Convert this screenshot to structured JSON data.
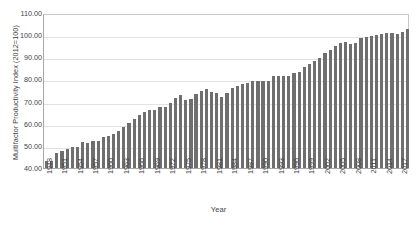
{
  "chart_data": {
    "type": "bar",
    "title": "",
    "xlabel": "Year",
    "ylabel": "Multifactor Productivity Index (2012=100)",
    "ylim": [
      40.0,
      110.0
    ],
    "ytick_labels": [
      "110.00",
      "100.00",
      "90.00",
      "80.00",
      "70.00",
      "60.00",
      "50.00",
      "40.00"
    ],
    "ytick_values": [
      110.0,
      100.0,
      90.0,
      80.0,
      70.0,
      60.0,
      50.0,
      40.0
    ],
    "grid": "horizontal",
    "legend": "none",
    "bar_color": "#6f6f6f",
    "xtick_labels": [
      "1948",
      "1951",
      "1954",
      "1957",
      "1960",
      "1963",
      "1966",
      "1969",
      "1972",
      "1975",
      "1978",
      "1981",
      "1984",
      "1987",
      "1990",
      "1993",
      "1996",
      "1999",
      "2002",
      "2005",
      "2008",
      "2011",
      "2014",
      "2017"
    ],
    "categories": [
      "1948",
      "1949",
      "1950",
      "1951",
      "1952",
      "1953",
      "1954",
      "1955",
      "1956",
      "1957",
      "1958",
      "1959",
      "1960",
      "1961",
      "1962",
      "1963",
      "1964",
      "1965",
      "1966",
      "1967",
      "1968",
      "1969",
      "1970",
      "1971",
      "1972",
      "1973",
      "1974",
      "1975",
      "1976",
      "1977",
      "1978",
      "1979",
      "1980",
      "1981",
      "1982",
      "1983",
      "1984",
      "1985",
      "1986",
      "1987",
      "1988",
      "1989",
      "1990",
      "1991",
      "1992",
      "1993",
      "1994",
      "1995",
      "1996",
      "1997",
      "1998",
      "1999",
      "2000",
      "2001",
      "2002",
      "2003",
      "2004",
      "2005",
      "2006",
      "2007",
      "2008",
      "2009",
      "2010",
      "2011",
      "2012",
      "2013",
      "2014",
      "2015",
      "2016",
      "2017",
      "2018"
    ],
    "values": [
      43.0,
      43.0,
      46.6,
      47.9,
      48.4,
      49.5,
      49.6,
      51.6,
      51.4,
      52.0,
      52.0,
      53.8,
      54.4,
      55.3,
      56.9,
      58.5,
      60.2,
      62.1,
      64.1,
      65.1,
      66.1,
      66.2,
      67.5,
      67.4,
      69.5,
      71.4,
      73.2,
      70.7,
      71.1,
      73.6,
      75.0,
      75.9,
      74.3,
      74.0,
      71.9,
      74.0,
      76.3,
      77.2,
      78.1,
      78.4,
      79.2,
      79.3,
      79.4,
      79.3,
      81.6,
      81.7,
      81.7,
      81.6,
      82.8,
      83.4,
      85.5,
      87.0,
      88.3,
      89.7,
      91.9,
      93.5,
      95.0,
      96.5,
      97.1,
      96.0,
      96.3,
      98.6,
      99.2,
      99.4,
      100.0,
      100.5,
      101.1,
      100.8,
      100.7,
      101.6,
      102.8
    ]
  }
}
